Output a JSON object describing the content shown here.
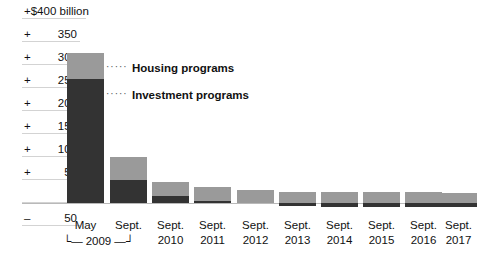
{
  "chart_data": {
    "type": "bar",
    "stacked": true,
    "title": "",
    "subtitle": "",
    "xlabel": "",
    "ylabel": "",
    "unit_label": "+$400 billion",
    "ylim": [
      -50,
      400
    ],
    "ytick_values": [
      400,
      350,
      300,
      250,
      200,
      150,
      100,
      50,
      0,
      -50
    ],
    "ytick_labels": [
      "+$400 billion",
      "+ 350",
      "+ 300",
      "+ 250",
      "+ 200",
      "+ 150",
      "+ 100",
      "+ 50",
      "0",
      "–  50"
    ],
    "grid": true,
    "legend_position": "inside-top-right",
    "categories": [
      "May 2009",
      "Sept. 2009",
      "Sept. 2010",
      "Sept. 2011",
      "Sept. 2012",
      "Sept. 2013",
      "Sept. 2014",
      "Sept. 2015",
      "Sept. 2016",
      "Sept. 2017"
    ],
    "series": [
      {
        "name": "Housing programs",
        "color": "#9a9a9a",
        "values": [
          56,
          50,
          31,
          30,
          28,
          25,
          24,
          24,
          25,
          22
        ]
      },
      {
        "name": "Investment programs",
        "color": "#333333",
        "values": [
          270,
          50,
          15,
          5,
          0,
          -7,
          -8,
          -8,
          -8,
          -8
        ]
      }
    ]
  },
  "axis": {
    "ticks": [
      {
        "sign": "+",
        "num": "",
        "whole": "+$400 billion",
        "top": true
      },
      {
        "sign": "+",
        "num": "350",
        "whole": "",
        "top": false
      },
      {
        "sign": "+",
        "num": "300",
        "whole": "",
        "top": false
      },
      {
        "sign": "+",
        "num": "250",
        "whole": "",
        "top": false
      },
      {
        "sign": "+",
        "num": "200",
        "whole": "",
        "top": false
      },
      {
        "sign": "+",
        "num": "150",
        "whole": "",
        "top": false
      },
      {
        "sign": "+",
        "num": "100",
        "whole": "",
        "top": false
      },
      {
        "sign": "+",
        "num": "50",
        "whole": "",
        "top": false
      },
      {
        "sign": "",
        "num": "0",
        "whole": "",
        "top": false
      },
      {
        "sign": "–",
        "num": "50",
        "whole": "",
        "top": false
      }
    ]
  },
  "legend": {
    "dots": "·····",
    "items": [
      {
        "label": "Housing programs"
      },
      {
        "label": "Investment programs"
      }
    ]
  },
  "xaxis": {
    "labels": [
      {
        "l1": "May",
        "l2": ""
      },
      {
        "l1": "Sept.",
        "l2": ""
      },
      {
        "l1": "Sept.",
        "l2": "2010"
      },
      {
        "l1": "Sept.",
        "l2": "2011"
      },
      {
        "l1": "Sept.",
        "l2": "2012"
      },
      {
        "l1": "Sept.",
        "l2": "2013"
      },
      {
        "l1": "Sept.",
        "l2": "2014"
      },
      {
        "l1": "Sept.",
        "l2": "2015"
      },
      {
        "l1": "Sept.",
        "l2": "2016"
      },
      {
        "l1": "Sept.",
        "l2": "2017"
      }
    ],
    "bracket": {
      "left_cap": "└",
      "right_cap": "┘",
      "year": "2009",
      "dash": "—"
    }
  },
  "colors": {
    "housing": "#9a9a9a",
    "investment": "#333333",
    "grid": "#d3d3d3",
    "axis": "#b9b9b9",
    "text": "#111111",
    "background": "#ffffff"
  }
}
